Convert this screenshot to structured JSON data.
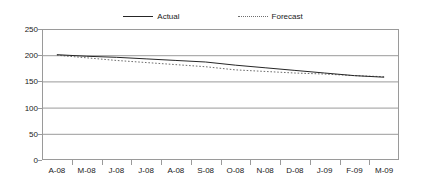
{
  "legend": {
    "position": "top-center",
    "entries": [
      {
        "label": "Actual",
        "style": "solid",
        "color": "#262626"
      },
      {
        "label": "Forecast",
        "style": "dotted",
        "color": "#6e6e6e"
      }
    ]
  },
  "axes": {
    "y_ticks": [
      "0",
      "50",
      "100",
      "150",
      "200",
      "250"
    ],
    "x_ticks": [
      "A-08",
      "M-08",
      "J-08",
      "J-08",
      "A-08",
      "S-08",
      "O-08",
      "N-08",
      "D-08",
      "J-09",
      "F-09",
      "M-09"
    ]
  },
  "chart_data": {
    "type": "line",
    "title": "",
    "subtitle": "",
    "xlabel": "",
    "ylabel": "",
    "categories": [
      "A-08",
      "M-08",
      "J-08",
      "J-08",
      "A-08",
      "S-08",
      "O-08",
      "N-08",
      "D-08",
      "J-09",
      "F-09",
      "M-09"
    ],
    "series": [
      {
        "name": "Actual",
        "style": "solid",
        "color": "#262626",
        "values": [
          201,
          198,
          196,
          193,
          190,
          187,
          181,
          176,
          171,
          166,
          161,
          158
        ]
      },
      {
        "name": "Forecast",
        "style": "dotted",
        "color": "#6e6e6e",
        "values": [
          200,
          195,
          190,
          186,
          182,
          178,
          172,
          169,
          166,
          164,
          161,
          159
        ]
      }
    ],
    "ylim": [
      0,
      250
    ],
    "ytick_interval": 50,
    "grid": "horizontal",
    "legend_position": "top-center"
  }
}
